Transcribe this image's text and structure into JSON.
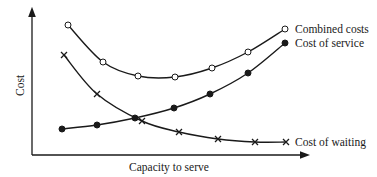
{
  "chart_data": {
    "type": "line",
    "title": "",
    "xlabel": "Capacity to serve",
    "ylabel": "Cost",
    "grid": false,
    "legend_position": "inline-right",
    "x": [
      1,
      2,
      3,
      4,
      5,
      6,
      7
    ],
    "series": [
      {
        "name": "Combined costs",
        "marker": "open-circle",
        "values": [
          25,
          62,
          76,
          77,
          68,
          52,
          29
        ]
      },
      {
        "name": "Cost of service",
        "marker": "filled-circle",
        "values": [
          129,
          125,
          118,
          108,
          94,
          73,
          43
        ]
      },
      {
        "name": "Cost of waiting",
        "marker": "x",
        "values": [
          55,
          94,
          121,
          132,
          139,
          142,
          142
        ]
      }
    ],
    "note": "Values are pixel y-positions (lower = higher cost); axes have no numeric ticks."
  },
  "labels": {
    "combined": "Combined costs",
    "service": "Cost of service",
    "waiting": "Cost of waiting",
    "xaxis": "Capacity to serve",
    "yaxis": "Cost"
  }
}
